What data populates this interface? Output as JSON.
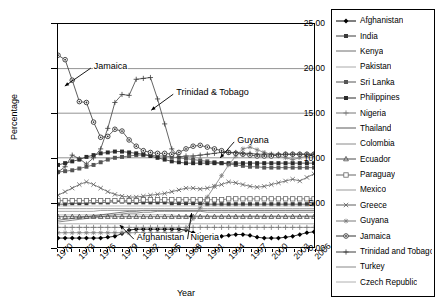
{
  "chart_data": {
    "type": "line",
    "title": "",
    "xlabel": "Year",
    "ylabel": "Percentage",
    "xlim": [
      1970,
      2006
    ],
    "ylim": [
      0,
      25
    ],
    "yticks": [
      "0.00",
      "5.00",
      "10.00",
      "15.00",
      "20.00",
      "25.00"
    ],
    "xticks": [
      "1970",
      "1973",
      "1976",
      "1979",
      "1982",
      "1985",
      "1988",
      "1991",
      "1994",
      "1997",
      "2000",
      "2003",
      "2006"
    ],
    "grid": "horizontal-at-15-and-20-and-10",
    "legend_position": "right",
    "x": [
      1970,
      1971,
      1972,
      1973,
      1974,
      1975,
      1976,
      1977,
      1978,
      1979,
      1980,
      1981,
      1982,
      1983,
      1984,
      1985,
      1986,
      1987,
      1988,
      1989,
      1990,
      1991,
      1992,
      1993,
      1994,
      1995,
      1996,
      1997,
      1998,
      1999,
      2000,
      2001,
      2002,
      2003,
      2004,
      2005,
      2006
    ],
    "annotations": [
      {
        "text": "Jamaica",
        "x": 1975.0,
        "y": 20.1
      },
      {
        "text": "Trinidad & Tobago",
        "x": 1986.5,
        "y": 17.2
      },
      {
        "text": "Guyana",
        "x": 1995.0,
        "y": 11.9
      },
      {
        "text": "Afghanistan",
        "x": 1981.0,
        "y": 1.1
      },
      {
        "text": "Nigeria",
        "x": 1988.5,
        "y": 1.1
      }
    ],
    "series": [
      {
        "name": "Afghanistan",
        "marker": "diamond-filled",
        "color": "#000000",
        "values": [
          1.0,
          1.0,
          1.0,
          1.0,
          1.0,
          1.0,
          1.0,
          1.1,
          1.2,
          1.5,
          1.9,
          2.0,
          2.0,
          2.0,
          2.0,
          2.0,
          2.0,
          2.0,
          1.9,
          1.6,
          1.4,
          1.2,
          1.2,
          1.2,
          1.3,
          1.4,
          1.4,
          1.3,
          1.1,
          1.0,
          1.0,
          1.0,
          1.1,
          1.2,
          1.4,
          1.6,
          1.7
        ]
      },
      {
        "name": "India",
        "marker": "square-filled",
        "color": "#3a3a3a",
        "values": [
          4.8,
          4.8,
          4.9,
          4.9,
          4.9,
          5.0,
          5.0,
          5.0,
          5.1,
          5.1,
          5.0,
          5.0,
          5.0,
          5.0,
          5.0,
          5.0,
          4.9,
          4.9,
          4.9,
          4.9,
          4.9,
          4.8,
          4.8,
          4.8,
          4.8,
          4.8,
          4.8,
          4.8,
          4.8,
          4.8,
          4.8,
          4.8,
          4.8,
          4.8,
          4.8,
          4.8,
          4.8
        ]
      },
      {
        "name": "Kenya",
        "marker": "none",
        "color": "#6e6e6e",
        "values": [
          2.8,
          2.9,
          3.0,
          3.1,
          3.2,
          3.3,
          3.4,
          3.5,
          3.6,
          3.7,
          3.8,
          3.8,
          3.9,
          3.9,
          4.0,
          4.0,
          4.0,
          4.0,
          4.0,
          4.0,
          4.0,
          3.9,
          3.9,
          3.9,
          3.9,
          3.9,
          3.9,
          3.9,
          3.9,
          3.9,
          3.9,
          3.9,
          3.9,
          3.9,
          3.9,
          3.9,
          3.9
        ]
      },
      {
        "name": "Pakistan",
        "marker": "none",
        "color": "#aaaaaa",
        "values": [
          3.6,
          3.6,
          3.6,
          3.6,
          3.6,
          3.6,
          3.6,
          3.6,
          3.6,
          3.6,
          3.6,
          3.6,
          3.6,
          3.6,
          3.6,
          3.6,
          3.6,
          3.5,
          3.5,
          3.5,
          3.5,
          3.5,
          3.5,
          3.5,
          3.5,
          3.5,
          3.5,
          3.5,
          3.5,
          3.5,
          3.5,
          3.5,
          3.5,
          3.5,
          3.5,
          3.5,
          3.5
        ]
      },
      {
        "name": "Sri Lanka",
        "marker": "square-filled",
        "color": "#555555",
        "values": [
          8.4,
          8.5,
          8.6,
          8.8,
          9.0,
          9.2,
          9.5,
          9.8,
          10.0,
          10.1,
          10.2,
          10.3,
          10.3,
          10.3,
          10.2,
          10.2,
          10.1,
          10.0,
          9.9,
          9.8,
          9.7,
          9.6,
          9.5,
          9.4,
          9.3,
          9.2,
          9.1,
          9.0,
          9.0,
          8.9,
          8.9,
          8.9,
          8.9,
          8.9,
          8.9,
          8.9,
          8.9
        ]
      },
      {
        "name": "Philippines",
        "marker": "square-filled",
        "color": "#2b2b2b",
        "values": [
          9.2,
          9.4,
          9.6,
          9.8,
          10.1,
          10.3,
          10.5,
          10.6,
          10.7,
          10.7,
          10.6,
          10.5,
          10.4,
          10.2,
          10.0,
          9.8,
          9.6,
          9.5,
          9.4,
          9.4,
          9.4,
          9.4,
          9.4,
          9.4,
          9.4,
          9.4,
          9.4,
          9.4,
          9.4,
          9.4,
          9.4,
          9.4,
          9.4,
          9.4,
          9.4,
          9.4,
          9.4
        ]
      },
      {
        "name": "Nigeria",
        "marker": "plus",
        "color": "#777777",
        "values": [
          2.2,
          2.2,
          2.2,
          2.2,
          2.2,
          2.2,
          2.2,
          2.2,
          2.2,
          2.2,
          2.2,
          2.2,
          2.2,
          2.2,
          2.2,
          2.2,
          2.2,
          2.2,
          2.2,
          2.2,
          2.2,
          2.2,
          2.2,
          2.2,
          2.2,
          2.2,
          2.2,
          2.2,
          2.2,
          2.2,
          2.2,
          2.2,
          2.2,
          2.2,
          2.2,
          2.2,
          2.2
        ]
      },
      {
        "name": "Thailand",
        "marker": "none",
        "color": "#5a5a5a",
        "values": [
          3.0,
          3.1,
          3.2,
          3.3,
          3.4,
          3.5,
          3.6,
          3.7,
          3.8,
          3.9,
          4.0,
          4.0,
          4.1,
          4.1,
          4.1,
          4.1,
          4.1,
          4.1,
          4.1,
          4.1,
          4.1,
          4.1,
          4.1,
          4.1,
          4.1,
          4.1,
          4.1,
          4.1,
          4.1,
          4.1,
          4.1,
          4.1,
          4.1,
          4.1,
          4.1,
          4.1,
          4.1
        ]
      },
      {
        "name": "Colombia",
        "marker": "none",
        "color": "#8a8a8a",
        "values": [
          4.3,
          4.3,
          4.3,
          4.3,
          4.3,
          4.3,
          4.3,
          4.3,
          4.3,
          4.3,
          4.3,
          4.3,
          4.3,
          4.3,
          4.3,
          4.3,
          4.3,
          4.3,
          4.3,
          4.3,
          4.3,
          4.3,
          4.3,
          4.3,
          4.3,
          4.3,
          4.3,
          4.3,
          4.3,
          4.3,
          4.3,
          4.3,
          4.3,
          4.3,
          4.3,
          4.3,
          4.3
        ]
      },
      {
        "name": "Ecuador",
        "marker": "triangle",
        "color": "#4a4a4a",
        "values": [
          3.4,
          3.4,
          3.4,
          3.4,
          3.4,
          3.4,
          3.4,
          3.4,
          3.4,
          3.4,
          3.4,
          3.4,
          3.4,
          3.4,
          3.4,
          3.4,
          3.4,
          3.4,
          3.4,
          3.4,
          3.4,
          3.4,
          3.4,
          3.4,
          3.4,
          3.4,
          3.4,
          3.4,
          3.4,
          3.4,
          3.4,
          3.4,
          3.4,
          3.4,
          3.4,
          3.4,
          3.4
        ]
      },
      {
        "name": "Paraguay",
        "marker": "square-open",
        "color": "#666666",
        "values": [
          5.2,
          5.2,
          5.2,
          5.2,
          5.2,
          5.2,
          5.2,
          5.2,
          5.2,
          5.2,
          5.2,
          5.2,
          5.3,
          5.3,
          5.3,
          5.3,
          5.3,
          5.3,
          5.3,
          5.3,
          5.3,
          5.3,
          5.3,
          5.3,
          5.4,
          5.4,
          5.4,
          5.4,
          5.4,
          5.4,
          5.4,
          5.4,
          5.4,
          5.4,
          5.4,
          5.4,
          5.4
        ]
      },
      {
        "name": "Mexico",
        "marker": "none",
        "color": "#999999",
        "values": [
          2.6,
          2.6,
          2.6,
          2.6,
          2.6,
          2.6,
          2.6,
          2.6,
          2.6,
          2.6,
          2.6,
          2.6,
          2.6,
          2.6,
          2.6,
          2.6,
          2.6,
          2.6,
          2.6,
          2.6,
          2.6,
          2.6,
          2.6,
          2.6,
          2.6,
          2.6,
          2.6,
          2.6,
          2.6,
          2.6,
          2.6,
          2.6,
          2.6,
          2.6,
          2.6,
          2.6,
          2.6
        ]
      },
      {
        "name": "Greece",
        "marker": "x",
        "color": "#5f5f5f",
        "values": [
          5.8,
          6.2,
          6.6,
          7.0,
          7.3,
          7.0,
          6.6,
          6.2,
          5.9,
          5.7,
          5.6,
          5.6,
          5.7,
          5.8,
          5.9,
          6.0,
          6.2,
          6.4,
          6.6,
          6.6,
          6.5,
          6.6,
          6.8,
          7.0,
          7.3,
          7.2,
          7.0,
          6.8,
          6.7,
          6.8,
          7.0,
          7.2,
          7.4,
          7.6,
          7.4,
          7.8,
          8.2
        ]
      },
      {
        "name": "Guyana",
        "marker": "star",
        "color": "#7a7a7a",
        "values": [
          1.6,
          1.6,
          1.6,
          1.6,
          1.6,
          1.6,
          1.6,
          1.6,
          1.6,
          1.6,
          1.6,
          1.6,
          1.6,
          1.6,
          1.6,
          1.6,
          1.6,
          1.6,
          2.0,
          3.2,
          4.4,
          5.6,
          6.8,
          8.0,
          9.2,
          10.2,
          11.0,
          11.2,
          10.9,
          10.6,
          10.4,
          10.2,
          10.0,
          9.8,
          10.0,
          10.2,
          10.4
        ]
      },
      {
        "name": "Jamaica",
        "marker": "circle-dot",
        "color": "#333333",
        "values": [
          21.5,
          21.0,
          18.7,
          16.3,
          16.2,
          14.0,
          12.3,
          12.4,
          13.2,
          13.0,
          12.0,
          11.3,
          10.8,
          10.6,
          10.5,
          10.5,
          10.4,
          10.6,
          11.0,
          11.3,
          11.4,
          11.2,
          11.0,
          10.8,
          10.6,
          10.5,
          10.4,
          10.3,
          10.2,
          10.2,
          10.2,
          10.3,
          10.4,
          10.4,
          10.4,
          10.4,
          10.4
        ]
      },
      {
        "name": "Trinidad and Tobago",
        "marker": "plus",
        "color": "#3c3c3c",
        "values": [
          8.4,
          9.0,
          10.3,
          9.9,
          9.3,
          10.0,
          11.0,
          13.3,
          16.2,
          17.1,
          17.0,
          18.8,
          18.9,
          19.0,
          16.6,
          13.8,
          11.0,
          10.1,
          10.2,
          10.2,
          10.3,
          10.4,
          10.5,
          10.6,
          10.6,
          10.6,
          10.5,
          10.5,
          10.4,
          10.4,
          10.4,
          10.4,
          10.4,
          10.4,
          10.4,
          10.4,
          10.4
        ]
      },
      {
        "name": "Turkey",
        "marker": "none",
        "color": "#888888",
        "values": [
          4.0,
          4.0,
          4.0,
          4.0,
          4.0,
          4.0,
          4.1,
          4.1,
          4.1,
          4.1,
          4.1,
          4.1,
          4.1,
          4.1,
          4.1,
          4.1,
          4.1,
          4.1,
          4.1,
          4.1,
          4.1,
          4.1,
          4.1,
          4.1,
          4.1,
          4.1,
          4.1,
          4.1,
          4.1,
          4.1,
          4.1,
          4.1,
          4.1,
          4.1,
          4.1,
          4.1,
          4.1
        ]
      },
      {
        "name": "Czech Republic",
        "marker": "none",
        "color": "#b0b0b0",
        "values": [
          4.6,
          4.6,
          4.6,
          4.6,
          4.6,
          4.6,
          4.6,
          4.6,
          4.6,
          4.6,
          4.6,
          4.6,
          4.6,
          4.6,
          4.6,
          4.6,
          4.6,
          4.6,
          4.6,
          4.6,
          4.6,
          4.6,
          4.6,
          4.6,
          4.6,
          4.6,
          4.6,
          4.6,
          4.6,
          4.6,
          4.6,
          4.6,
          4.6,
          4.6,
          4.6,
          4.6,
          4.6
        ]
      }
    ]
  }
}
